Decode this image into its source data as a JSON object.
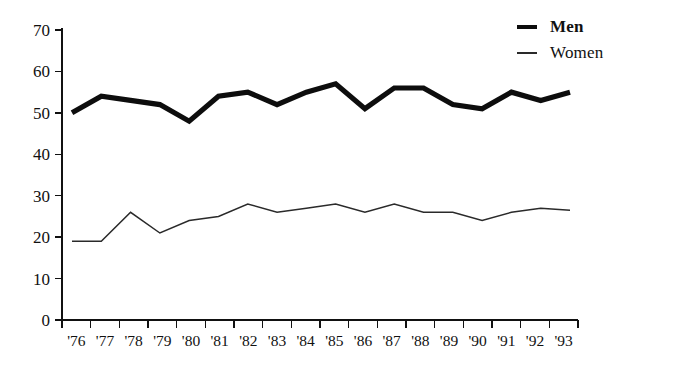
{
  "chart_data": {
    "type": "line",
    "title": "",
    "subtitle": "",
    "xlabel": "",
    "ylabel": "",
    "x": [
      "'76",
      "'77",
      "'78",
      "'79",
      "'80",
      "'81",
      "'82",
      "'83",
      "'84",
      "'85",
      "'86",
      "'87",
      "'88",
      "'89",
      "'90",
      "'91",
      "'92",
      "'93"
    ],
    "categories": [
      "'76",
      "'77",
      "'78",
      "'79",
      "'80",
      "'81",
      "'82",
      "'83",
      "'84",
      "'85",
      "'86",
      "'87",
      "'88",
      "'89",
      "'90",
      "'91",
      "'92",
      "'93"
    ],
    "series": [
      {
        "name": "Men",
        "values": [
          50,
          54,
          53,
          52,
          48,
          54,
          55,
          52,
          55,
          57,
          51,
          56,
          56,
          52,
          51,
          55,
          53,
          55
        ],
        "color": "#0d0d0d",
        "line_width": "thick",
        "label_bold": true
      },
      {
        "name": "Women",
        "values": [
          19,
          19,
          26,
          21,
          24,
          25,
          28,
          26,
          27,
          28,
          26,
          28,
          26,
          26,
          24,
          26,
          27,
          26.5
        ],
        "color": "#2a2a2a",
        "line_width": "thin",
        "label_bold": false
      }
    ],
    "ylim": [
      0,
      70
    ],
    "ytick_values": [
      0,
      10,
      20,
      30,
      40,
      50,
      60,
      70
    ],
    "ytick_labels": [
      "0",
      "10",
      "20",
      "30",
      "40",
      "50",
      "60",
      "70"
    ],
    "xtick_labels": [
      "'76",
      "'77",
      "'78",
      "'79",
      "'80",
      "'81",
      "'82",
      "'83",
      "'84",
      "'85",
      "'86",
      "'87",
      "'88",
      "'89",
      "'90",
      "'91",
      "'92",
      "'93"
    ],
    "grid": false,
    "legend_position": "top-right",
    "legend_entries": [
      "Men",
      "Women"
    ]
  },
  "legend": {
    "men_label": "Men",
    "women_label": "Women"
  }
}
